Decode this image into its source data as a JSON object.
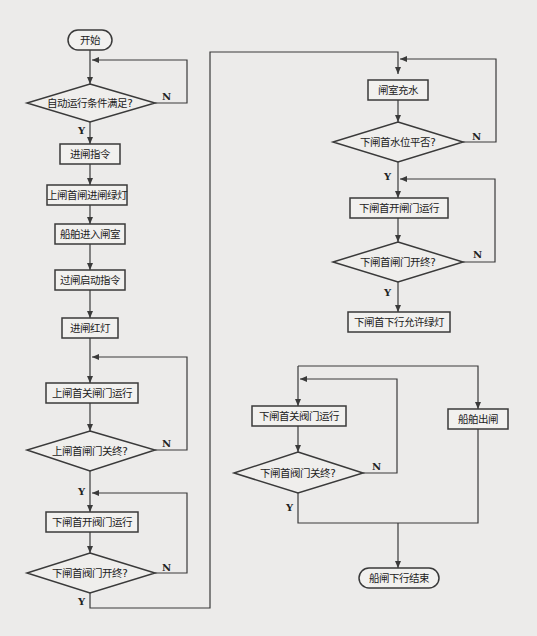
{
  "diagram": {
    "type": "flowchart",
    "colors": {
      "line": "#3a3a3a",
      "background": "#ecebea",
      "node_fill": "#f2f1ef"
    },
    "nodes": {
      "start": "开始",
      "cond_auto": "自动运行条件满足?",
      "enter_cmd": "进闸指令",
      "upper_green": "上闸首闸进闸绿灯",
      "ship_enter": "船舶进入闸室",
      "pass_cmd": "过闸启动指令",
      "enter_red": "进闸红灯",
      "upper_close_run": "上闸首关闸门运行",
      "cond_upper_closed": "上闸首闸门关终?",
      "lower_open_valve_run": "下闸首开阀门运行",
      "cond_lower_valve_open": "下闸首阀门开终?",
      "chamber_fill": "闸室充水",
      "cond_lower_level": "下闸首水位平否?",
      "lower_open_gate_run": "下闸首开闸门运行",
      "cond_lower_gate_open": "下闸首闸门开终?",
      "lower_down_green": "下闸首下行允许绿灯",
      "lower_close_valve_run": "下闸首关阀门运行",
      "cond_lower_valve_closed": "下闸首阀门关终?",
      "ship_exit": "船舶出闸",
      "end": "船闸下行结束"
    },
    "branch_labels": {
      "yes": "Y",
      "no": "N"
    }
  }
}
